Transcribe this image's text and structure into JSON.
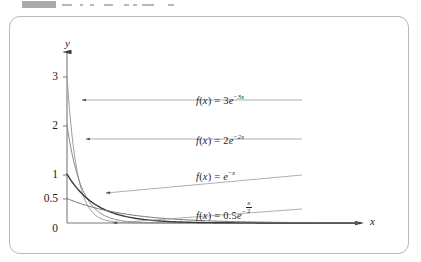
{
  "top_strip": {
    "present": true,
    "description": "cut-off toolbar fragment",
    "blocks": [
      {
        "x": 22,
        "w": 34
      },
      {
        "x": 62,
        "w": 10
      },
      {
        "x": 80,
        "w": 3
      },
      {
        "x": 90,
        "w": 4
      },
      {
        "x": 104,
        "w": 9
      },
      {
        "x": 124,
        "w": 5
      },
      {
        "x": 133,
        "w": 4
      },
      {
        "x": 142,
        "w": 12
      },
      {
        "x": 168,
        "w": 6
      }
    ]
  },
  "figure": {
    "background_color": "#ffffff",
    "border_color": "#b9b9b9",
    "axis_color": "#7a7a7a"
  },
  "chart_data": {
    "type": "line",
    "title": "",
    "subtitle": "",
    "xlabel": "x",
    "ylabel": "y",
    "xlim": [
      0,
      10
    ],
    "ylim": [
      0,
      3.35
    ],
    "grid": false,
    "legend_position": "inline-annotations",
    "y_ticks": [
      {
        "value": 3,
        "label": "3"
      },
      {
        "value": 2,
        "label": "2"
      },
      {
        "value": 1,
        "label": "1"
      },
      {
        "value": 0.5,
        "label": "0.5"
      },
      {
        "value": 0,
        "label": "0"
      }
    ],
    "x_ticks": [],
    "series": [
      {
        "name": "f(x) = 3e^{-3x}",
        "label_html": "<i>f</i>(<i>x</i>) = 3<i>e</i><span class=\"sup\"><span class=\"rm\">−</span>3x</span>",
        "coefficient": 3,
        "rate": 3,
        "color": "#9d9d9d",
        "width": 1.0,
        "y_intercept": 3,
        "points": [
          [
            0,
            3
          ],
          [
            0.1,
            2.222
          ],
          [
            0.2,
            1.646
          ],
          [
            0.3,
            1.22
          ],
          [
            0.4,
            0.904
          ],
          [
            0.5,
            0.669
          ],
          [
            0.6,
            0.496
          ],
          [
            0.8,
            0.272
          ],
          [
            1.0,
            0.149
          ],
          [
            1.5,
            0.033
          ],
          [
            2.0,
            0.007
          ],
          [
            3.0,
            0.0004
          ],
          [
            5,
            0
          ],
          [
            10,
            0
          ]
        ],
        "annotation": {
          "text": "f(x) = 3e^{-3x}",
          "anchor_x": 0.155,
          "anchor_y": 2.58
        }
      },
      {
        "name": "f(x) = 2e^{-2x}",
        "label_html": "<i>f</i>(<i>x</i>) = 2<i>e</i><span class=\"sup\"><span class=\"rm\">−</span>2x</span>",
        "coefficient": 2,
        "rate": 2,
        "color": "#8a8a8a",
        "width": 1.0,
        "y_intercept": 2,
        "points": [
          [
            0,
            2
          ],
          [
            0.1,
            1.637
          ],
          [
            0.2,
            1.341
          ],
          [
            0.3,
            1.098
          ],
          [
            0.4,
            0.899
          ],
          [
            0.5,
            0.736
          ],
          [
            0.7,
            0.493
          ],
          [
            1.0,
            0.271
          ],
          [
            1.3,
            0.149
          ],
          [
            1.8,
            0.055
          ],
          [
            2.5,
            0.013
          ],
          [
            3.5,
            0.002
          ],
          [
            5,
            0
          ],
          [
            10,
            0
          ]
        ],
        "annotation": {
          "text": "f(x) = 2e^{-2x}",
          "anchor_x": 0.26,
          "anchor_y": 1.82
        }
      },
      {
        "name": "f(x) = e^{-x}",
        "label_html": "<i>f</i>(<i>x</i>) = <i>e</i><span class=\"sup\"><span class=\"rm\">−</span>x</span>",
        "coefficient": 1,
        "rate": 1,
        "color": "#3c3c3c",
        "width": 1.4,
        "y_intercept": 1,
        "points": [
          [
            0,
            1
          ],
          [
            0.2,
            0.819
          ],
          [
            0.4,
            0.67
          ],
          [
            0.6,
            0.549
          ],
          [
            0.9,
            0.407
          ],
          [
            1.2,
            0.301
          ],
          [
            1.6,
            0.202
          ],
          [
            2.0,
            0.135
          ],
          [
            2.6,
            0.074
          ],
          [
            3.4,
            0.033
          ],
          [
            4.4,
            0.012
          ],
          [
            6,
            0.002
          ],
          [
            8,
            0.0003
          ],
          [
            10,
            0
          ]
        ],
        "annotation": {
          "text": "f(x) = e^{-x}",
          "anchor_x": 1.05,
          "anchor_y": 0.96
        }
      },
      {
        "name": "f(x) = 0.5e^{-x/2}",
        "label_html": "<i>f</i>(<i>x</i>) = 0.5<i>e</i><span class=\"frac-wrap\"><span class=\"minus-sup\">−</span><span class=\"frac\"><span class=\"num\">x</span><span class=\"den\">2</span></span></span>",
        "coefficient": 0.5,
        "rate": 0.5,
        "color": "#6f6f6f",
        "width": 1.0,
        "y_intercept": 0.5,
        "points": [
          [
            0,
            0.5
          ],
          [
            0.5,
            0.389
          ],
          [
            1.0,
            0.303
          ],
          [
            1.5,
            0.236
          ],
          [
            2.0,
            0.184
          ],
          [
            2.8,
            0.123
          ],
          [
            3.6,
            0.083
          ],
          [
            4.6,
            0.05
          ],
          [
            5.8,
            0.027
          ],
          [
            7.0,
            0.015
          ],
          [
            8.5,
            0.007
          ],
          [
            10,
            0.003
          ]
        ],
        "annotation": {
          "text": "f(x) = 0.5e^{-x/2}",
          "anchor_x": 1.55,
          "anchor_y": 0.5
        }
      }
    ]
  },
  "annotations": [
    {
      "id": "ann-3e",
      "label_left": 186,
      "label_top": 76,
      "leader_from_x": 292,
      "leader_from_y": 83,
      "leader_to_x": 72,
      "leader_to_y": 83
    },
    {
      "id": "ann-2e",
      "label_left": 186,
      "label_top": 116,
      "leader_from_x": 292,
      "leader_from_y": 122,
      "leader_to_x": 76,
      "leader_to_y": 122
    },
    {
      "id": "ann-e",
      "label_left": 186,
      "label_top": 152,
      "leader_from_x": 292,
      "leader_from_y": 158,
      "leader_to_x": 96,
      "leader_to_y": 176
    },
    {
      "id": "ann-05e",
      "label_left": 186,
      "label_top": 186,
      "leader_from_x": 292,
      "leader_from_y": 192,
      "leader_to_x": 103,
      "leader_to_y": 206
    }
  ]
}
